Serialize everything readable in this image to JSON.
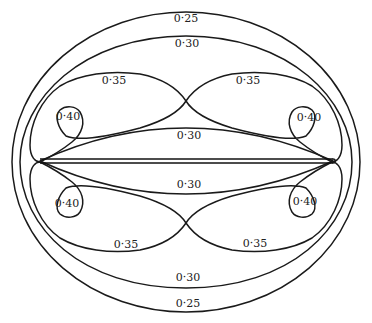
{
  "diagram": {
    "type": "contour-map",
    "line_color": "#1a1a1a",
    "background": "#ffffff",
    "contours": [
      {
        "id": "outer-025",
        "value": "0·25"
      },
      {
        "id": "outer-030",
        "value": "0·30"
      },
      {
        "id": "lobe-035",
        "value": "0·35"
      },
      {
        "id": "loop-040",
        "value": "0·40"
      },
      {
        "id": "inner-030",
        "value": "0·30"
      }
    ],
    "labels": {
      "top_025": "0·25",
      "top_030": "0·30",
      "upper_left_035": "0·35",
      "upper_right_035": "0·35",
      "upper_left_040": "0·40",
      "upper_right_040": "0·40",
      "inner_upper_030": "0·30",
      "inner_lower_030": "0·30",
      "lower_left_040": "0·40",
      "lower_right_040": "0·40",
      "lower_left_035": "0·35",
      "lower_right_035": "0·35",
      "bottom_030": "0·30",
      "bottom_025": "0·25"
    }
  }
}
